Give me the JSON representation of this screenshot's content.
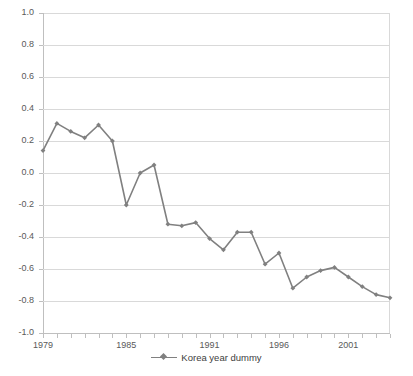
{
  "chart_data": {
    "type": "line",
    "title": "",
    "xlabel": "",
    "ylabel": "",
    "ylim": [
      -1.0,
      1.0
    ],
    "xlim": [
      1979,
      2004
    ],
    "grid": true,
    "legend_position": "bottom",
    "y_ticks": [
      "1.0",
      "0.8",
      "0.6",
      "0.4",
      "0.2",
      "0.0",
      "-0.2",
      "-0.4",
      "-0.6",
      "-0.8",
      "-1.0"
    ],
    "y_tick_values": [
      1.0,
      0.8,
      0.6,
      0.4,
      0.2,
      0.0,
      -0.2,
      -0.4,
      -0.6,
      -0.8,
      -1.0
    ],
    "x_tick_labels": [
      "1979",
      "1985",
      "1991",
      "1996",
      "2001"
    ],
    "x_tick_values": [
      1979,
      1985,
      1991,
      1996,
      2001
    ],
    "x": [
      1979,
      1980,
      1981,
      1982,
      1983,
      1984,
      1985,
      1986,
      1987,
      1988,
      1989,
      1990,
      1991,
      1992,
      1993,
      1994,
      1995,
      1996,
      1997,
      1998,
      1999,
      2000,
      2001,
      2002,
      2003,
      2004
    ],
    "series": [
      {
        "name": "Korea year dummy",
        "color": "#808080",
        "marker": "diamond",
        "values": [
          0.14,
          0.31,
          0.26,
          0.22,
          0.3,
          0.2,
          -0.2,
          0.0,
          0.05,
          -0.32,
          -0.33,
          -0.31,
          -0.41,
          -0.48,
          -0.37,
          -0.37,
          -0.57,
          -0.5,
          -0.72,
          -0.65,
          -0.61,
          -0.59,
          -0.65,
          -0.71,
          -0.76,
          -0.78
        ]
      }
    ]
  },
  "legend": {
    "label": "Korea year dummy",
    "marker_name": "diamond-line-marker"
  },
  "colors": {
    "series": "#808080",
    "gridline": "#d9d9d9",
    "axis": "#bfbfbf",
    "tick_text": "#595959",
    "background": "#ffffff"
  }
}
